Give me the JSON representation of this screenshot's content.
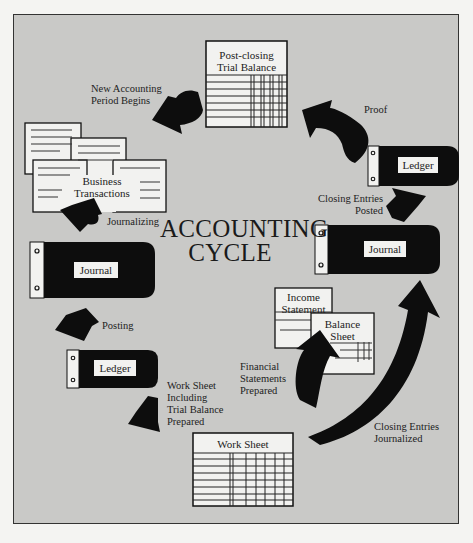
{
  "title": "ACCOUNTING\nCYCLE",
  "colors": {
    "background": "#c9c9c7",
    "arrow": "#0d0d0d",
    "binder": "#0d0d0d",
    "paper": "#f2f2f0",
    "text": "#222222"
  },
  "nodes": {
    "post_closing_trial_balance": "Post-closing\nTrial Balance",
    "business_transactions": "Business\nTransactions",
    "journal_left": "Journal",
    "ledger_left": "Ledger",
    "work_sheet": "Work Sheet",
    "income_statement": "Income\nStatement",
    "balance_sheet": "Balance\nSheet",
    "journal_right": "Journal",
    "ledger_right": "Ledger"
  },
  "steps": {
    "new_period": "New Accounting\nPeriod Begins",
    "journalizing": "Journalizing",
    "posting": "Posting",
    "work_sheet_prepared": "Work Sheet\nIncluding\nTrial Balance\nPrepared",
    "financial_statements": "Financial\nStatements\nPrepared",
    "closing_journalized": "Closing Entries\nJournalized",
    "closing_posted": "Closing Entries\nPosted",
    "proof": "Proof"
  }
}
